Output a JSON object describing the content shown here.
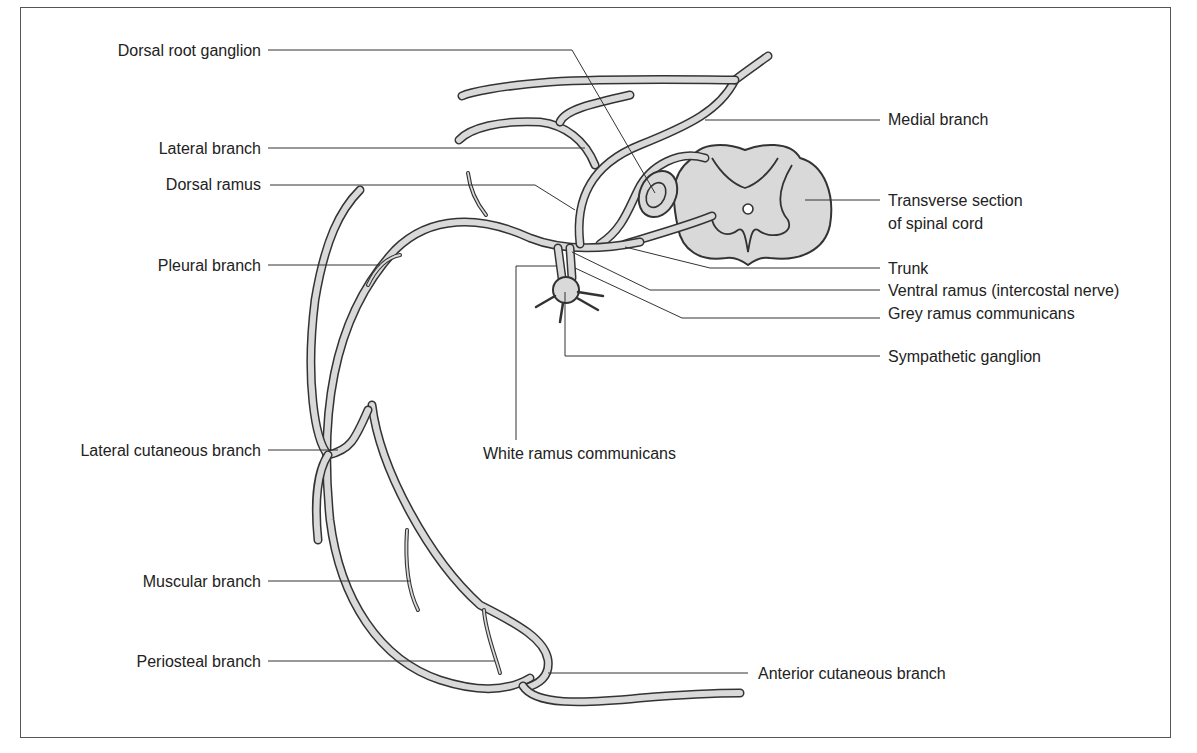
{
  "diagram": {
    "colors": {
      "nerve_fill": "#d9d9d9",
      "outline": "#333333",
      "text": "#222222",
      "frame": "#555555",
      "background": "#ffffff"
    },
    "labels_left": [
      {
        "id": "dorsal-root-ganglion",
        "text": "Dorsal root ganglion"
      },
      {
        "id": "lateral-branch",
        "text": "Lateral branch"
      },
      {
        "id": "dorsal-ramus",
        "text": "Dorsal ramus"
      },
      {
        "id": "pleural-branch",
        "text": "Pleural branch"
      },
      {
        "id": "lateral-cutaneous-branch",
        "text": "Lateral cutaneous branch"
      },
      {
        "id": "muscular-branch",
        "text": "Muscular branch"
      },
      {
        "id": "periosteal-branch",
        "text": "Periosteal branch"
      }
    ],
    "labels_right": [
      {
        "id": "medial-branch",
        "text": "Medial branch"
      },
      {
        "id": "transverse-section-line1",
        "text": "Transverse section"
      },
      {
        "id": "transverse-section-line2",
        "text": "of spinal cord"
      },
      {
        "id": "trunk",
        "text": "Trunk"
      },
      {
        "id": "ventral-ramus",
        "text": "Ventral ramus (intercostal nerve)"
      },
      {
        "id": "grey-ramus",
        "text": "Grey ramus communicans"
      },
      {
        "id": "sympathetic-ganglion",
        "text": "Sympathetic ganglion"
      },
      {
        "id": "anterior-cutaneous-branch",
        "text": "Anterior cutaneous branch"
      }
    ],
    "labels_center": [
      {
        "id": "white-ramus",
        "text": "White ramus communicans"
      }
    ]
  }
}
